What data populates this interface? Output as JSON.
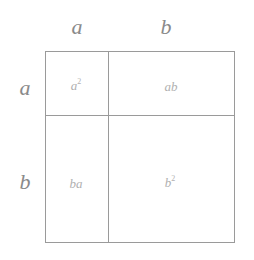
{
  "diagram": {
    "title": "",
    "top_labels": [
      {
        "text": "a",
        "x": 77,
        "y": 27
      },
      {
        "text": "b",
        "x": 166,
        "y": 27
      }
    ],
    "side_labels": [
      {
        "text": "a",
        "x": 25,
        "y": 88
      },
      {
        "text": "b",
        "x": 25,
        "y": 182
      }
    ],
    "cells": [
      {
        "base": "a",
        "sup": "2",
        "text": "a²",
        "x": 76,
        "y": 85
      },
      {
        "base": "ab",
        "sup": "",
        "text": "ab",
        "x": 171,
        "y": 86
      },
      {
        "base": "ba",
        "sup": "",
        "text": "ba",
        "x": 76,
        "y": 183
      },
      {
        "base": "b",
        "sup": "2",
        "text": "b²",
        "x": 170,
        "y": 182
      }
    ],
    "grid": {
      "left": 45,
      "top": 51,
      "right": 234,
      "bottom": 242,
      "vertical_divider_x": 108,
      "horizontal_divider_y": 115,
      "line_color": "#9a9a9a"
    },
    "colors": {
      "axis_label": "#8a8a8a",
      "cell_label": "#b0b0b0",
      "background": "#ffffff"
    }
  }
}
